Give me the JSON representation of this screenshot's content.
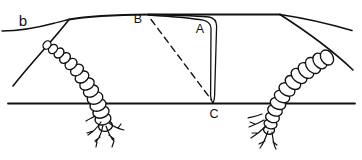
{
  "figure": {
    "panel_label": "b",
    "points": {
      "A": "A",
      "B": "B",
      "C": "C"
    },
    "colors": {
      "ink": "#111111",
      "background": "#ffffff"
    }
  }
}
